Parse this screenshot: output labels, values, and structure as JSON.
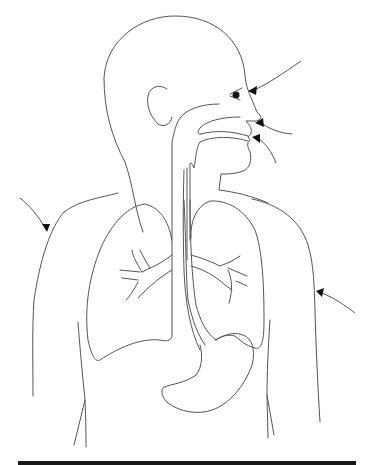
{
  "diagram": {
    "structures": [
      "head",
      "ear",
      "nose",
      "nasal-cavity",
      "mouth",
      "tongue",
      "throat",
      "trachea",
      "esophagus",
      "left-lung",
      "right-lung",
      "bronchi",
      "stomach",
      "torso"
    ],
    "pointer_arrows": [
      {
        "id": "arrow-nose",
        "target": "nostril"
      },
      {
        "id": "arrow-nasal-passage",
        "target": "upper-lip/nasal-passage"
      },
      {
        "id": "arrow-mouth",
        "target": "mouth"
      },
      {
        "id": "arrow-left-shoulder",
        "target": "left-shoulder"
      },
      {
        "id": "arrow-right-side",
        "target": "right-torso"
      }
    ],
    "labels": []
  },
  "colors": {
    "line": "#555555",
    "arrowhead": "#111111",
    "background": "#ffffff",
    "bottom_bar": "#1a1a1a"
  }
}
